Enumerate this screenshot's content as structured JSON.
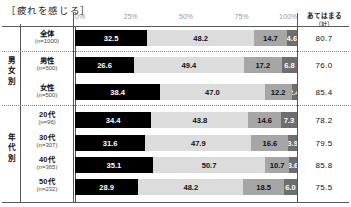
{
  "title": "［疲れを感じる］",
  "axis": {
    "ticks": [
      "0%",
      "25%",
      "50%",
      "75%",
      "100%"
    ],
    "min": 0,
    "max": 100
  },
  "right_column": {
    "header_line1": "あてはまる",
    "header_line2": "（計）"
  },
  "groups": {
    "gender": "男女別",
    "age": "年代別"
  },
  "rows": [
    {
      "label": "全体",
      "n": "(n=1000)",
      "values": [
        32.5,
        48.2,
        14.7,
        4.6
      ],
      "value_labels": [
        "32.5",
        "48.2",
        "14.7",
        "4.6"
      ],
      "total": "80.7"
    },
    {
      "label": "男性",
      "n": "(n=500)",
      "values": [
        26.6,
        49.4,
        17.2,
        6.8
      ],
      "value_labels": [
        "26.6",
        "49.4",
        "17.2",
        "6.8"
      ],
      "total": "76.0"
    },
    {
      "label": "女性",
      "n": "(n=500)",
      "values": [
        38.4,
        47.0,
        12.2,
        2.4
      ],
      "value_labels": [
        "38.4",
        "47.0",
        "12.2",
        "2.4"
      ],
      "total": "85.4"
    },
    {
      "label": "20代",
      "n": "(n=96)",
      "values": [
        34.4,
        43.8,
        14.6,
        7.3
      ],
      "value_labels": [
        "34.4",
        "43.8",
        "14.6",
        "7.3"
      ],
      "total": "78.2"
    },
    {
      "label": "30代",
      "n": "(n=307)",
      "values": [
        31.6,
        47.9,
        16.6,
        3.9
      ],
      "value_labels": [
        "31.6",
        "47.9",
        "16.6",
        "3.9"
      ],
      "total": "79.5"
    },
    {
      "label": "40代",
      "n": "(n=365)",
      "values": [
        35.1,
        50.7,
        10.7,
        3.6
      ],
      "value_labels": [
        "35.1",
        "50.7",
        "10.7",
        "3.6"
      ],
      "total": "85.8"
    },
    {
      "label": "50代",
      "n": "(n=232)",
      "values": [
        28.9,
        48.2,
        18.5,
        6.0
      ],
      "value_labels": [
        "28.9",
        "48.2",
        "18.5",
        "6.0"
      ],
      "total": "75.5"
    }
  ],
  "colors": {
    "segment_1": "#000000",
    "segment_2": "#dcdcdc",
    "segment_3": "#a6a6a6",
    "segment_4": "#6e6e6e"
  },
  "chart_data": {
    "type": "bar",
    "title": "［疲れを感じる］",
    "xlabel": "",
    "ylabel": "",
    "xlim": [
      0,
      100
    ],
    "grid": false,
    "legend_position": "none",
    "orientation": "horizontal",
    "stacked": true,
    "stacked_100": true,
    "categories": [
      "全体 (n=1000)",
      "男性 (n=500)",
      "女性 (n=500)",
      "20代 (n=96)",
      "30代 (n=307)",
      "40代 (n=365)",
      "50代 (n=232)"
    ],
    "series": [
      {
        "name": "segment_1",
        "color": "#000000",
        "values": [
          32.5,
          26.6,
          38.4,
          34.4,
          31.6,
          35.1,
          28.9
        ]
      },
      {
        "name": "segment_2",
        "color": "#dcdcdc",
        "values": [
          48.2,
          49.4,
          47.0,
          43.8,
          47.9,
          50.7,
          48.2
        ]
      },
      {
        "name": "segment_3",
        "color": "#a6a6a6",
        "values": [
          14.7,
          17.2,
          12.2,
          14.6,
          16.6,
          10.7,
          18.5
        ]
      },
      {
        "name": "segment_4",
        "color": "#6e6e6e",
        "values": [
          4.6,
          6.8,
          2.4,
          7.3,
          3.9,
          3.6,
          6.0
        ]
      }
    ],
    "annotations": {
      "right_column_header": "あてはまる（計）",
      "right_column_values": [
        80.7,
        76.0,
        85.4,
        78.2,
        79.5,
        85.8,
        75.5
      ]
    },
    "tick_labels": [
      "0%",
      "25%",
      "50%",
      "75%",
      "100%"
    ]
  }
}
